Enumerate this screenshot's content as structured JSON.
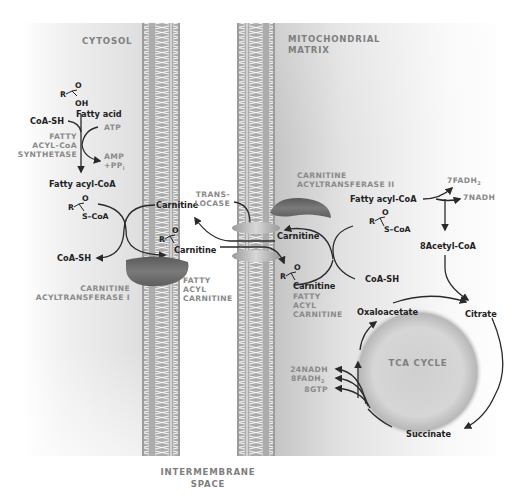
{
  "regions": {
    "cytosol": "CYTOSOL",
    "matrix_line1": "MITOCHONDRIAL",
    "matrix_line2": "MATRIX",
    "intermembrane_line1": "INTERMEMBRANE",
    "intermembrane_line2": "SPACE"
  },
  "activation": {
    "fatty_acid": "Fatty acid",
    "coa_sh": "CoA-SH",
    "atp": "ATP",
    "enzyme_line1": "FATTY",
    "enzyme_line2": "ACYL-CoA",
    "enzyme_line3": "SYNTHETASE",
    "amp": "AMP",
    "ppi": "+PP",
    "ppi_sub": "i",
    "fatty_acyl_coa": "Fatty acyl-CoA"
  },
  "structure": {
    "r": "R",
    "o": "O",
    "oh": "OH",
    "s_coa": "S–CoA",
    "carnitine": "Carnitine"
  },
  "cat1": {
    "carnitine_in": "Carnitine",
    "coa_sh_out": "CoA-SH",
    "acyl_carnitine": "Carnitine",
    "enzyme_line1": "CARNITINE",
    "enzyme_line2": "ACYLTRANSFERASE I",
    "product_line1": "FATTY",
    "product_line2": "ACYL",
    "product_line3": "CARNITINE"
  },
  "translocase": {
    "line1": "TRANS-",
    "line2": "LOCASE"
  },
  "cat2": {
    "enzyme_line1": "CARNITINE",
    "enzyme_line2": "ACYLTRANSFERASE II",
    "carnitine_out": "Carnitine",
    "acyl_carnitine": "Carnitine",
    "product_line1": "FATTY",
    "product_line2": "ACYL",
    "product_line3": "CARNITINE",
    "fatty_acyl_coa": "Fatty acyl-CoA",
    "coa_sh_in": "CoA-SH"
  },
  "beta_oxidation": {
    "fadh2": "7FADH",
    "fadh2_sub": "2",
    "nadh": "7NADH",
    "acetyl_coa": "8Acetyl-CoA"
  },
  "tca": {
    "title": "TCA CYCLE",
    "oxaloacetate": "Oxaloacetate",
    "citrate": "Citrate",
    "succinate": "Succinate",
    "nadh": "24NADH",
    "fadh2": "8FADH",
    "fadh2_sub": "2",
    "gtp": "8GTP"
  },
  "colors": {
    "membrane": "#a9a9a9",
    "enzyme": "#6e6e6e",
    "label_gray": "#8a8a8a",
    "text_dark": "#222222"
  }
}
